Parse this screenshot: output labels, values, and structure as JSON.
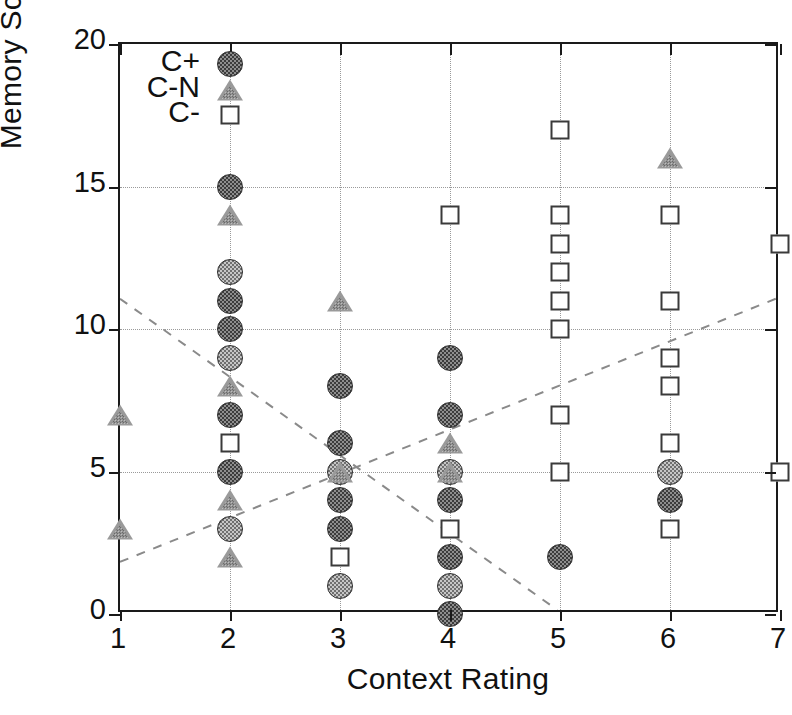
{
  "chart_data": {
    "type": "scatter",
    "title": "",
    "xlabel": "Context Rating",
    "ylabel": "Memory Score",
    "xlim": [
      1,
      7
    ],
    "ylim": [
      0,
      20
    ],
    "xticks": [
      "1",
      "2",
      "3",
      "4",
      "5",
      "6",
      "7"
    ],
    "yticks": [
      "0",
      "5",
      "10",
      "15",
      "20"
    ],
    "grid": "dotted both axes",
    "legend_position": "upper left inside plot",
    "legend": [
      {
        "label": "C+",
        "marker": "filled-circle"
      },
      {
        "label": "C-N",
        "marker": "filled-triangle"
      },
      {
        "label": "C-",
        "marker": "open-square"
      }
    ],
    "series": [
      {
        "name": "C+",
        "marker": "filled-circle",
        "points": [
          [
            2,
            15
          ],
          [
            2,
            12
          ],
          [
            2,
            11
          ],
          [
            2,
            10
          ],
          [
            2,
            9
          ],
          [
            2,
            7
          ],
          [
            2,
            5
          ],
          [
            2,
            3
          ],
          [
            3,
            8
          ],
          [
            3,
            6
          ],
          [
            3,
            5
          ],
          [
            3,
            4
          ],
          [
            3,
            3
          ],
          [
            3,
            1
          ],
          [
            4,
            9
          ],
          [
            4,
            7
          ],
          [
            4,
            5
          ],
          [
            4,
            4
          ],
          [
            4,
            2
          ],
          [
            4,
            1
          ],
          [
            4,
            0
          ],
          [
            5,
            2
          ],
          [
            6,
            5
          ],
          [
            6,
            4
          ]
        ]
      },
      {
        "name": "C-N",
        "marker": "filled-triangle",
        "points": [
          [
            1,
            7
          ],
          [
            1,
            3
          ],
          [
            2,
            14
          ],
          [
            2,
            8
          ],
          [
            2,
            4
          ],
          [
            2,
            2
          ],
          [
            3,
            11
          ],
          [
            3,
            5
          ],
          [
            4,
            6
          ],
          [
            4,
            5
          ],
          [
            6,
            16
          ]
        ]
      },
      {
        "name": "C-",
        "marker": "open-square",
        "points": [
          [
            2,
            6
          ],
          [
            3,
            2
          ],
          [
            4,
            14
          ],
          [
            4,
            3
          ],
          [
            5,
            17
          ],
          [
            5,
            14
          ],
          [
            5,
            13
          ],
          [
            5,
            12
          ],
          [
            5,
            11
          ],
          [
            5,
            10
          ],
          [
            5,
            7
          ],
          [
            5,
            5
          ],
          [
            6,
            14
          ],
          [
            6,
            11
          ],
          [
            6,
            9
          ],
          [
            6,
            8
          ],
          [
            6,
            6
          ],
          [
            6,
            3
          ],
          [
            7,
            13
          ],
          [
            7,
            5
          ]
        ]
      }
    ],
    "trend_lines": [
      {
        "name": "declining-trend-line",
        "style": "dashed",
        "x0": 1,
        "y0": 11.0,
        "x1": 5.0,
        "y1": 0.0
      },
      {
        "name": "ascending-trend-line",
        "style": "dashed",
        "x0": 1,
        "y0": 1.7,
        "x1": 7.0,
        "y1": 11.0
      }
    ],
    "legend_marker_x": 2,
    "legend_marker_y": [
      19.3,
      18.4,
      17.5
    ],
    "colors": {
      "marker_dark": "#3c3c3c",
      "marker_light": "#9a9a9a",
      "axis": "#1a1a1a",
      "grid": "#9a9a9a",
      "trend": "#8a8a8a"
    }
  }
}
